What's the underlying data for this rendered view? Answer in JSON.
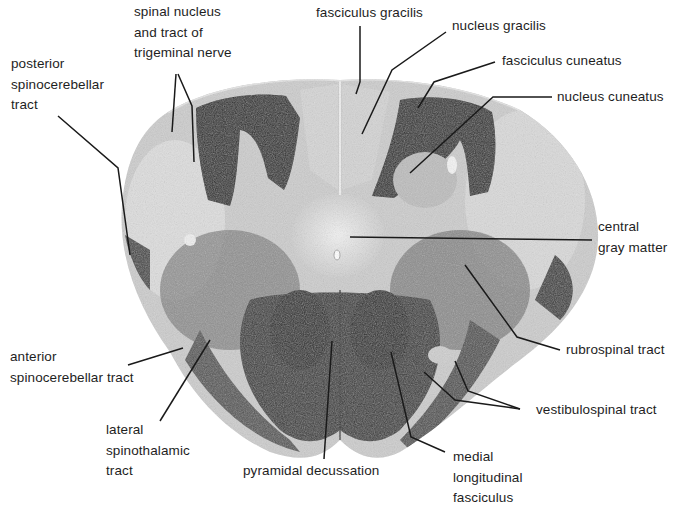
{
  "figure": {
    "type": "labeled histological cross-section",
    "colors": {
      "background": "#ffffff",
      "tissue_light": "#dcdcdc",
      "tissue_mid": "#8a8a8a",
      "tissue_dark": "#2a2a2a",
      "leader_line": "#1a1a1a",
      "text": "#1e1e1e"
    }
  },
  "labels": [
    {
      "id": "spinal-nucleus-trigeminal",
      "lines": [
        "spinal nucleus",
        "and tract of",
        "trigeminal nerve"
      ],
      "x": 134,
      "y": 2
    },
    {
      "id": "fasciculus-gracilis",
      "lines": [
        "fasciculus gracilis"
      ],
      "x": 316,
      "y": 3
    },
    {
      "id": "nucleus-gracilis",
      "lines": [
        "nucleus gracilis"
      ],
      "x": 452,
      "y": 16
    },
    {
      "id": "fasciculus-cuneatus",
      "lines": [
        "fasciculus cuneatus"
      ],
      "x": 502,
      "y": 51
    },
    {
      "id": "nucleus-cuneatus",
      "lines": [
        "nucleus cuneatus"
      ],
      "x": 557,
      "y": 87
    },
    {
      "id": "posterior-spinocerebellar",
      "lines": [
        "posterior",
        "spinocerebellar",
        "tract"
      ],
      "x": 11,
      "y": 54
    },
    {
      "id": "central-gray-matter",
      "lines": [
        "central",
        "gray matter"
      ],
      "x": 598,
      "y": 217
    },
    {
      "id": "rubrospinal-tract",
      "lines": [
        "rubrospinal tract"
      ],
      "x": 566,
      "y": 340
    },
    {
      "id": "anterior-spinocerebellar",
      "lines": [
        "anterior",
        "spinocerebellar tract"
      ],
      "x": 10,
      "y": 347
    },
    {
      "id": "vestibulospinal-tract",
      "lines": [
        "vestibulospinal tract"
      ],
      "x": 536,
      "y": 400
    },
    {
      "id": "lateral-spinothalamic",
      "lines": [
        "lateral",
        "spinothalamic",
        "tract"
      ],
      "x": 106,
      "y": 420
    },
    {
      "id": "pyramidal-decussation",
      "lines": [
        "pyramidal decussation"
      ],
      "x": 243,
      "y": 461
    },
    {
      "id": "medial-longitudinal-fasciculus",
      "lines": [
        "medial",
        "longitudinal",
        "fasciculus"
      ],
      "x": 453,
      "y": 447
    }
  ],
  "leaders": [
    {
      "for": "spinal-nucleus-trigeminal",
      "points": [
        [
          176,
          74
        ],
        [
          172,
          132
        ]
      ]
    },
    {
      "for": "spinal-nucleus-trigeminal",
      "points": [
        [
          178,
          74
        ],
        [
          192,
          106
        ],
        [
          194,
          162
        ]
      ]
    },
    {
      "for": "fasciculus-gracilis",
      "points": [
        [
          360,
          26
        ],
        [
          360,
          82
        ],
        [
          356,
          94
        ]
      ]
    },
    {
      "for": "nucleus-gracilis",
      "points": [
        [
          446,
          32
        ],
        [
          392,
          70
        ],
        [
          362,
          134
        ]
      ]
    },
    {
      "for": "fasciculus-cuneatus",
      "points": [
        [
          495,
          62
        ],
        [
          434,
          82
        ],
        [
          418,
          108
        ]
      ]
    },
    {
      "for": "nucleus-cuneatus",
      "points": [
        [
          552,
          97
        ],
        [
          493,
          97
        ],
        [
          410,
          173
        ]
      ]
    },
    {
      "for": "posterior-spinocerebellar",
      "points": [
        [
          58,
          116
        ],
        [
          118,
          168
        ],
        [
          130,
          255
        ]
      ]
    },
    {
      "for": "central-gray-matter",
      "points": [
        [
          350,
          237
        ],
        [
          592,
          240
        ]
      ]
    },
    {
      "for": "rubrospinal-tract",
      "points": [
        [
          465,
          265
        ],
        [
          517,
          337
        ],
        [
          560,
          350
        ]
      ]
    },
    {
      "for": "anterior-spinocerebellar",
      "points": [
        [
          128,
          365
        ],
        [
          183,
          348
        ]
      ]
    },
    {
      "for": "vestibulospinal-tract",
      "points": [
        [
          455,
          361
        ],
        [
          468,
          391
        ],
        [
          520,
          409
        ]
      ]
    },
    {
      "for": "vestibulospinal-tract",
      "points": [
        [
          424,
          372
        ],
        [
          455,
          400
        ],
        [
          520,
          409
        ]
      ]
    },
    {
      "for": "lateral-spinothalamic",
      "points": [
        [
          160,
          421
        ],
        [
          210,
          340
        ]
      ]
    },
    {
      "for": "pyramidal-decussation",
      "points": [
        [
          324,
          459
        ],
        [
          332,
          341
        ]
      ]
    },
    {
      "for": "medial-longitudinal-fasciculus",
      "points": [
        [
          445,
          452
        ],
        [
          411,
          437
        ],
        [
          391,
          352
        ]
      ]
    }
  ]
}
